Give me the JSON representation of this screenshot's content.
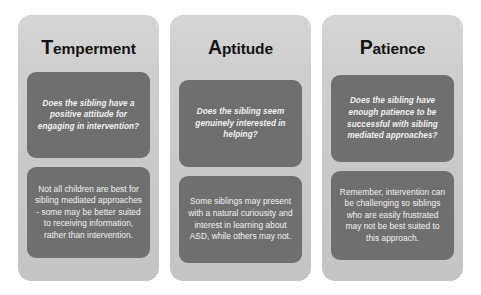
{
  "diagram": {
    "colors": {
      "page_background": "#ffffff",
      "card_background": "#cfcfcf",
      "inner_box_background": "#6f6f6f",
      "heading_text": "#141414",
      "inner_box_text": "#f2f2f2"
    },
    "columns": [
      {
        "id": "temperment",
        "heading": "Temperment",
        "heading_initial": "T",
        "heading_rest": "emperment",
        "question": "Does the sibling have a positive attitude for engaging in intervention?",
        "statement": "Not all children are best for sibling  mediated approaches - some may be better suited to receiving information, rather than intervention."
      },
      {
        "id": "aptitude",
        "heading": "Aptitude",
        "heading_initial": "A",
        "heading_rest": "ptitude",
        "question": "Does the sibling seem genuinely interested in helping?",
        "statement": "Some siblings may present with a natural curiousity and interest in learning about ASD, while others may not."
      },
      {
        "id": "patience",
        "heading": "Patience",
        "heading_initial": "P",
        "heading_rest": "atience",
        "question": "Does the sibling have enough patience to be successful with sibling mediated approaches?",
        "statement": "Remember, intervention can be challenging so siblings who are easily frustrated may not be best suited to this approach."
      }
    ]
  }
}
